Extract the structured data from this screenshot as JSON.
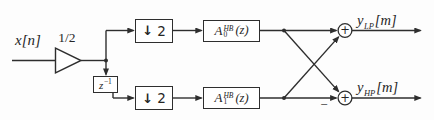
{
  "diagram": {
    "kind": "signal-flow block diagram",
    "colors": {
      "stroke": "#2e2e2e",
      "text": "#262626",
      "background": "#fdfdfd",
      "block_fill": "#ffffff"
    },
    "input": {
      "signal": "x[n]"
    },
    "gain": {
      "label": "1/2"
    },
    "delay": {
      "base": "z",
      "exponent": "−1"
    },
    "downsampler_top": {
      "arrow": "↓",
      "factor": "2"
    },
    "downsampler_bottom": {
      "arrow": "↓",
      "factor": "2"
    },
    "filter_top": {
      "base": "A",
      "superscript": "HB",
      "subscript": "0",
      "argument": "(z)"
    },
    "filter_bottom": {
      "base": "A",
      "superscript": "HB",
      "subscript": "1",
      "argument": "(z)"
    },
    "adder_top": {
      "sign": "+"
    },
    "adder_bottom": {
      "sign": "+",
      "negated_input_sign": "−"
    },
    "output_top": {
      "base": "y",
      "subscript": "LP",
      "argument": "[m]"
    },
    "output_bottom": {
      "base": "y",
      "subscript": "HP",
      "argument": "[m]"
    }
  }
}
